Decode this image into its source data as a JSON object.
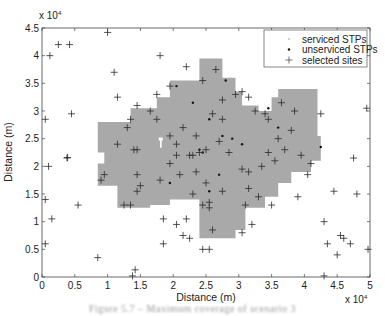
{
  "chart_data": {
    "type": "scatter",
    "title": "",
    "xlabel": "Distance (m)",
    "ylabel": "Distance (m)",
    "x_multiplier": "x 10^4",
    "y_multiplier": "x 10^4",
    "xlim": [
      0,
      5
    ],
    "ylim": [
      0,
      4.5
    ],
    "xticks": [
      0,
      0.5,
      1,
      1.5,
      2,
      2.5,
      3,
      3.5,
      4,
      4.5,
      5
    ],
    "xtick_labels": [
      "0",
      "0.5",
      "1",
      "1.5",
      "2",
      "2.5",
      "3",
      "3.5",
      "4",
      "4.5",
      "5"
    ],
    "yticks": [
      0,
      0.5,
      1,
      1.5,
      2,
      2.5,
      3,
      3.5,
      4,
      4.5
    ],
    "ytick_labels": [
      "0",
      "0.5",
      "1",
      "1.5",
      "2",
      "2.5",
      "3",
      "3.5",
      "4",
      "4.5"
    ],
    "grid": false,
    "legend_position": "upper right",
    "legend": [
      {
        "label": "serviced STPs",
        "marker": "dot-light"
      },
      {
        "label": "unserviced STPs",
        "marker": "dot-dark"
      },
      {
        "label": "selected sites",
        "marker": "plus"
      }
    ],
    "serviced_region": [
      [
        0.85,
        1.65
      ],
      [
        0.85,
        2.05
      ],
      [
        0.95,
        2.05
      ],
      [
        0.95,
        2.25
      ],
      [
        0.85,
        2.25
      ],
      [
        0.85,
        2.8
      ],
      [
        1.35,
        2.8
      ],
      [
        1.35,
        3.05
      ],
      [
        1.75,
        3.05
      ],
      [
        1.75,
        3.25
      ],
      [
        1.95,
        3.25
      ],
      [
        1.95,
        3.55
      ],
      [
        2.4,
        3.55
      ],
      [
        2.4,
        3.95
      ],
      [
        2.75,
        3.95
      ],
      [
        2.75,
        3.6
      ],
      [
        2.95,
        3.6
      ],
      [
        2.95,
        3.35
      ],
      [
        3.05,
        3.35
      ],
      [
        3.05,
        3.1
      ],
      [
        3.3,
        3.1
      ],
      [
        3.3,
        3.0
      ],
      [
        3.5,
        3.0
      ],
      [
        3.5,
        3.25
      ],
      [
        3.6,
        3.25
      ],
      [
        3.6,
        3.4
      ],
      [
        4.2,
        3.4
      ],
      [
        4.2,
        2.55
      ],
      [
        4.25,
        2.55
      ],
      [
        4.25,
        2.1
      ],
      [
        4.1,
        2.1
      ],
      [
        4.1,
        1.9
      ],
      [
        3.8,
        1.9
      ],
      [
        3.8,
        1.7
      ],
      [
        3.6,
        1.7
      ],
      [
        3.6,
        1.45
      ],
      [
        3.4,
        1.45
      ],
      [
        3.4,
        1.25
      ],
      [
        3.1,
        1.25
      ],
      [
        3.1,
        0.85
      ],
      [
        2.95,
        0.85
      ],
      [
        2.95,
        0.7
      ],
      [
        2.4,
        0.7
      ],
      [
        2.4,
        1.4
      ],
      [
        1.95,
        1.4
      ],
      [
        1.95,
        1.3
      ],
      [
        1.65,
        1.3
      ],
      [
        1.65,
        1.25
      ],
      [
        1.15,
        1.25
      ],
      [
        1.15,
        1.65
      ]
    ],
    "unserviced_STPs": [
      [
        2.05,
        3.45
      ],
      [
        2.3,
        3.15
      ],
      [
        2.8,
        3.55
      ],
      [
        2.55,
        2.85
      ],
      [
        2.9,
        2.5
      ],
      [
        2.4,
        2.3
      ],
      [
        2.45,
        2.25
      ],
      [
        3.05,
        2.4
      ],
      [
        2.7,
        1.85
      ],
      [
        1.95,
        1.7
      ],
      [
        2.55,
        1.55
      ],
      [
        3.6,
        2.7
      ],
      [
        4.25,
        2.35
      ],
      [
        3.45,
        3.05
      ],
      [
        2.75,
        2.55
      ]
    ],
    "selected_sites": [
      [
        0.25,
        4.2
      ],
      [
        0.42,
        4.2
      ],
      [
        1.0,
        4.42
      ],
      [
        1.1,
        3.7
      ],
      [
        1.15,
        3.25
      ],
      [
        0.45,
        2.95
      ],
      [
        0.05,
        2.85
      ],
      [
        0.1,
        2.0
      ],
      [
        0.05,
        1.4
      ],
      [
        0.15,
        1.05
      ],
      [
        0.05,
        0.6
      ],
      [
        0.38,
        2.15
      ],
      [
        0.39,
        2.16
      ],
      [
        0.55,
        1.3
      ],
      [
        0.9,
        1.75
      ],
      [
        0.85,
        0.35
      ],
      [
        1.38,
        0.02
      ],
      [
        1.42,
        0.13
      ],
      [
        0.95,
        1.85
      ],
      [
        1.3,
        2.7
      ],
      [
        1.15,
        2.4
      ],
      [
        1.4,
        2.3
      ],
      [
        1.45,
        2.3
      ],
      [
        1.35,
        2.85
      ],
      [
        1.45,
        3.1
      ],
      [
        1.75,
        3.3
      ],
      [
        1.95,
        3.45
      ],
      [
        2.2,
        3.8
      ],
      [
        2.45,
        3.55
      ],
      [
        2.65,
        3.75
      ],
      [
        1.8,
        4.0
      ],
      [
        1.65,
        3.0
      ],
      [
        1.75,
        2.85
      ],
      [
        2.05,
        2.4
      ],
      [
        2.05,
        2.2
      ],
      [
        2.25,
        2.2
      ],
      [
        2.3,
        2.2
      ],
      [
        2.4,
        2.25
      ],
      [
        2.5,
        2.3
      ],
      [
        2.7,
        2.45
      ],
      [
        2.85,
        2.25
      ],
      [
        1.95,
        2.05
      ],
      [
        2.1,
        1.85
      ],
      [
        2.35,
        1.9
      ],
      [
        2.5,
        1.7
      ],
      [
        2.75,
        1.55
      ],
      [
        2.55,
        1.35
      ],
      [
        2.3,
        1.5
      ],
      [
        1.95,
        2.55
      ],
      [
        2.15,
        2.7
      ],
      [
        2.6,
        2.95
      ],
      [
        2.75,
        3.2
      ],
      [
        2.95,
        3.3
      ],
      [
        3.05,
        3.35
      ],
      [
        3.15,
        3.25
      ],
      [
        3.25,
        3.0
      ],
      [
        3.4,
        2.95
      ],
      [
        3.45,
        2.85
      ],
      [
        3.65,
        3.15
      ],
      [
        3.85,
        3.0
      ],
      [
        3.8,
        2.65
      ],
      [
        3.6,
        2.5
      ],
      [
        3.7,
        2.3
      ],
      [
        3.45,
        2.25
      ],
      [
        3.55,
        2.1
      ],
      [
        3.35,
        2.0
      ],
      [
        3.05,
        1.95
      ],
      [
        3.15,
        1.9
      ],
      [
        3.95,
        2.2
      ],
      [
        4.1,
        2.05
      ],
      [
        4.05,
        1.85
      ],
      [
        1.45,
        1.85
      ],
      [
        1.5,
        1.65
      ],
      [
        1.8,
        1.75
      ],
      [
        1.45,
        1.55
      ],
      [
        1.25,
        1.3
      ],
      [
        1.35,
        1.3
      ],
      [
        2.45,
        1.3
      ],
      [
        2.55,
        1.25
      ],
      [
        2.2,
        1.05
      ],
      [
        1.85,
        1.05
      ],
      [
        2.05,
        0.95
      ],
      [
        2.25,
        0.7
      ],
      [
        2.55,
        0.5
      ],
      [
        2.15,
        0.75
      ],
      [
        2.6,
        0.85
      ],
      [
        3.05,
        0.8
      ],
      [
        3.3,
        1.45
      ],
      [
        3.1,
        1.3
      ],
      [
        3.5,
        1.3
      ],
      [
        3.2,
        0.95
      ],
      [
        3.9,
        1.45
      ],
      [
        4.25,
        2.95
      ],
      [
        4.3,
        1.0
      ],
      [
        4.55,
        0.75
      ],
      [
        4.45,
        1.55
      ],
      [
        4.8,
        1.5
      ],
      [
        4.6,
        0.7
      ],
      [
        4.7,
        0.6
      ],
      [
        4.5,
        0.4
      ],
      [
        4.3,
        0.02
      ],
      [
        4.35,
        0.6
      ],
      [
        4.97,
        0.5
      ],
      [
        4.75,
        2.15
      ],
      [
        3.15,
        1.6
      ],
      [
        2.45,
        0.5
      ],
      [
        1.85,
        0.6
      ],
      [
        0.12,
        4.0
      ],
      [
        4.95,
        3.05
      ],
      [
        2.75,
        2.85
      ],
      [
        2.35,
        2.55
      ]
    ]
  },
  "caption": "Figure 5.7 – Maximum coverage of scenario 3"
}
